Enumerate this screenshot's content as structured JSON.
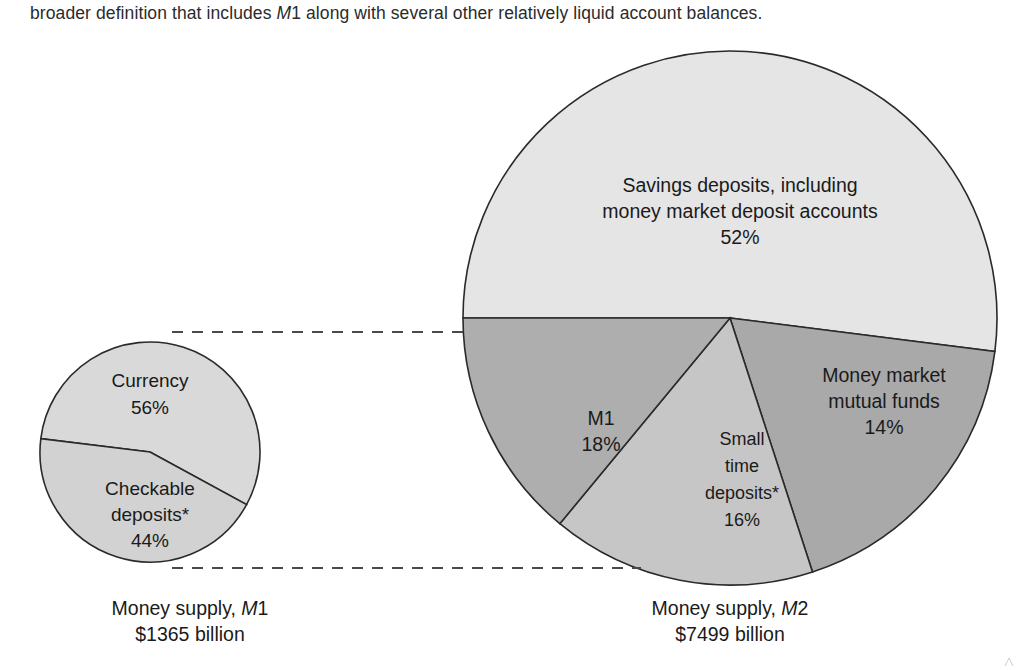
{
  "intro": {
    "text_before": "broader definition that includes ",
    "text_italic": "M",
    "text_italic_tail": "1",
    "text_after": " along with several other relatively liquid account balances."
  },
  "colors": {
    "savings": "#e5e5e5",
    "m1_wedge": "#a9a9a9",
    "small_time": "#c6c6c6",
    "mmmf": "#aeaeae",
    "small_pie_currency": "#d9d9d9",
    "small_pie_checkable": "#d2d2d2",
    "stroke": "#2a2a2a",
    "dashed": "#4a4a4a",
    "background": "#ffffff",
    "text": "#1a1a1a"
  },
  "chart_data": {
    "type": "pie",
    "title": "",
    "charts": [
      {
        "name": "Money supply, M1",
        "caption_line1_prefix": "Money supply, ",
        "caption_line1_italic": "M",
        "caption_line1_suffix": "1",
        "caption_line2": "$1365 billion",
        "total_billion": 1365,
        "center": [
          150,
          452
        ],
        "radius": 110,
        "slices": [
          {
            "label": "Currency",
            "value": 56,
            "display": "56%",
            "color": "#d9d9d9",
            "label_lines": [
              "Currency",
              "56%"
            ]
          },
          {
            "label": "Checkable deposits*",
            "value": 44,
            "display": "44%",
            "color": "#d2d2d2",
            "label_lines": [
              "Checkable",
              "deposits*",
              "44%"
            ]
          }
        ]
      },
      {
        "name": "Money supply, M2",
        "caption_line1_prefix": "Money supply, ",
        "caption_line1_italic": "M",
        "caption_line1_suffix": "2",
        "caption_line2": "$7499 billion",
        "total_billion": 7499,
        "center": [
          730,
          318
        ],
        "radius": 267,
        "slices": [
          {
            "label": "Savings deposits, including money market deposit accounts",
            "value": 52,
            "display": "52%",
            "color": "#e5e5e5",
            "label_lines": [
              "Savings deposits, including",
              "money market deposit accounts",
              "52%"
            ]
          },
          {
            "label": "M1",
            "value": 18,
            "display": "18%",
            "color": "#a9a9a9",
            "label_lines": [
              "M1",
              "18%"
            ]
          },
          {
            "label": "Small time deposits*",
            "value": 16,
            "display": "16%",
            "color": "#c6c6c6",
            "label_lines": [
              "Small",
              "time",
              "deposits*",
              "16%"
            ]
          },
          {
            "label": "Money market mutual funds",
            "value": 14,
            "display": "14%",
            "color": "#aeaeae",
            "label_lines": [
              "Money market",
              "mutual funds",
              "14%"
            ]
          }
        ]
      }
    ],
    "connectors": [
      {
        "name": "top-connector",
        "x1": 172,
        "y1": 332,
        "x2": 468,
        "y2": 332
      },
      {
        "name": "bottom-connector",
        "x1": 172,
        "y1": 568,
        "x2": 641,
        "y2": 568
      }
    ],
    "legend_position": "in-slice",
    "grid": false
  },
  "labels": {
    "small_pie": {
      "currency_name": "Currency",
      "currency_pct": "56%",
      "checkable_l1": "Checkable",
      "checkable_l2": "deposits*",
      "checkable_pct": "44%"
    },
    "large_pie": {
      "savings_l1": "Savings deposits, including",
      "savings_l2": "money market deposit accounts",
      "savings_pct": "52%",
      "m1_name": "M1",
      "m1_pct": "18%",
      "small_l1": "Small",
      "small_l2": "time",
      "small_l3": "deposits*",
      "small_pct": "16%",
      "mmmf_l1": "Money market",
      "mmmf_l2": "mutual funds",
      "mmmf_pct": "14%"
    }
  },
  "captions": {
    "m1_line1_prefix": "Money supply, ",
    "m1_line1_italic": "M",
    "m1_line1_suffix": "1",
    "m1_line2": "$1365 billion",
    "m2_line1_prefix": "Money supply, ",
    "m2_line1_italic": "M",
    "m2_line1_suffix": "2",
    "m2_line2": "$7499 billion"
  }
}
